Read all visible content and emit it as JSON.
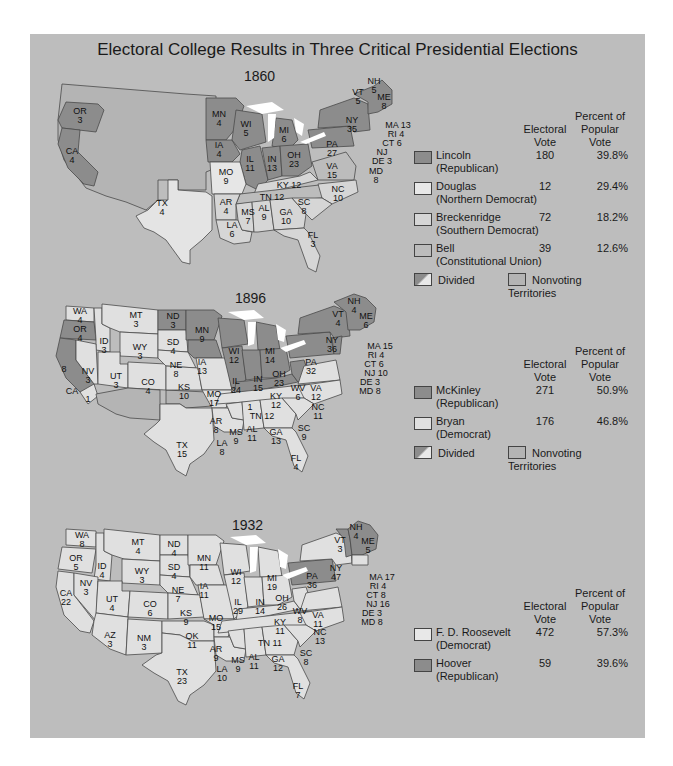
{
  "title": "Electoral College Results in Three Critical Presidential Elections",
  "colors": {
    "panel": "#bdbdbd",
    "republican_win": "#8c8c8c",
    "light_win": "#e6e6e6",
    "breckenridge": "#d6d6d6",
    "bell": "#bcbcbc",
    "nonvoting": "#b4b4b4",
    "lakes": "#ffffff",
    "border": "#4a4a4a"
  },
  "legend_headers": {
    "electoral": "Electoral Vote",
    "electoral_line1": "Electoral",
    "electoral_line2": "Vote",
    "popular_line1": "Percent of",
    "popular_line2": "Popular",
    "popular_line3": "Vote"
  },
  "elections": [
    {
      "year": "1860",
      "candidates": [
        {
          "name": "Lincoln",
          "party": "(Republican)",
          "electoral_vote": "180",
          "popular_vote": "39.8%",
          "color": "#8c8c8c"
        },
        {
          "name": "Douglas",
          "party": "(Northern Democrat)",
          "electoral_vote": "12",
          "popular_vote": "29.4%",
          "color": "#e8e8e8"
        },
        {
          "name": "Breckenridge",
          "party": "(Southern Democrat)",
          "electoral_vote": "72",
          "popular_vote": "18.2%",
          "color": "#d6d6d6"
        },
        {
          "name": "Bell",
          "party": "(Constitutional Union)",
          "electoral_vote": "39",
          "popular_vote": "12.6%",
          "color": "#bcbcbc"
        }
      ],
      "footer": {
        "divided": "Divided",
        "nonvoting": "Nonvoting Territories"
      },
      "states": [
        {
          "abbr": "OR",
          "votes": "3"
        },
        {
          "abbr": "CA",
          "votes": "4"
        },
        {
          "abbr": "TX",
          "votes": "4"
        },
        {
          "abbr": "MN",
          "votes": "4"
        },
        {
          "abbr": "IA",
          "votes": "4"
        },
        {
          "abbr": "MO",
          "votes": "9"
        },
        {
          "abbr": "AR",
          "votes": "4"
        },
        {
          "abbr": "LA",
          "votes": "6"
        },
        {
          "abbr": "WI",
          "votes": "5"
        },
        {
          "abbr": "IL",
          "votes": "11"
        },
        {
          "abbr": "MI",
          "votes": "6"
        },
        {
          "abbr": "IN",
          "votes": "13"
        },
        {
          "abbr": "OH",
          "votes": "23"
        },
        {
          "abbr": "KY",
          "votes": "12"
        },
        {
          "abbr": "TN",
          "votes": "12"
        },
        {
          "abbr": "MS",
          "votes": "7"
        },
        {
          "abbr": "AL",
          "votes": "9"
        },
        {
          "abbr": "GA",
          "votes": "10"
        },
        {
          "abbr": "FL",
          "votes": "3"
        },
        {
          "abbr": "SC",
          "votes": "8"
        },
        {
          "abbr": "NC",
          "votes": "10"
        },
        {
          "abbr": "VA",
          "votes": "15"
        },
        {
          "abbr": "PA",
          "votes": "27"
        },
        {
          "abbr": "NY",
          "votes": "35"
        },
        {
          "abbr": "VT",
          "votes": "5"
        },
        {
          "abbr": "NH",
          "votes": "5"
        },
        {
          "abbr": "ME",
          "votes": "8"
        },
        {
          "abbr": "MA",
          "votes": "13"
        },
        {
          "abbr": "RI",
          "votes": "4"
        },
        {
          "abbr": "CT",
          "votes": "6"
        },
        {
          "abbr": "NJ",
          "votes": ""
        },
        {
          "abbr": "DE",
          "votes": "3"
        },
        {
          "abbr": "MD",
          "votes": "8"
        }
      ]
    },
    {
      "year": "1896",
      "candidates": [
        {
          "name": "McKinley",
          "party": "(Republican)",
          "electoral_vote": "271",
          "popular_vote": "50.9%",
          "color": "#8c8c8c"
        },
        {
          "name": "Bryan",
          "party": "(Democrat)",
          "electoral_vote": "176",
          "popular_vote": "46.8%",
          "color": "#e0e0e0"
        }
      ],
      "footer": {
        "divided": "Divided",
        "nonvoting": "Nonvoting Territories"
      },
      "states": [
        {
          "abbr": "WA",
          "votes": "4"
        },
        {
          "abbr": "OR",
          "votes": "4"
        },
        {
          "abbr": "CA",
          "votes": "8"
        },
        {
          "abbr": "CA-split",
          "votes": "1"
        },
        {
          "abbr": "ID",
          "votes": "3"
        },
        {
          "abbr": "NV",
          "votes": "3"
        },
        {
          "abbr": "MT",
          "votes": "3"
        },
        {
          "abbr": "WY",
          "votes": "3"
        },
        {
          "abbr": "UT",
          "votes": "3"
        },
        {
          "abbr": "CO",
          "votes": "4"
        },
        {
          "abbr": "ND",
          "votes": "3"
        },
        {
          "abbr": "SD",
          "votes": "4"
        },
        {
          "abbr": "NE",
          "votes": "8"
        },
        {
          "abbr": "KS",
          "votes": "10"
        },
        {
          "abbr": "TX",
          "votes": "15"
        },
        {
          "abbr": "MN",
          "votes": "9"
        },
        {
          "abbr": "IA",
          "votes": "13"
        },
        {
          "abbr": "MO",
          "votes": "17"
        },
        {
          "abbr": "AR",
          "votes": "8"
        },
        {
          "abbr": "LA",
          "votes": "8"
        },
        {
          "abbr": "WI",
          "votes": "12"
        },
        {
          "abbr": "IL",
          "votes": "24"
        },
        {
          "abbr": "MI",
          "votes": "14"
        },
        {
          "abbr": "IN",
          "votes": "15"
        },
        {
          "abbr": "OH",
          "votes": "23"
        },
        {
          "abbr": "KY",
          "votes": "12"
        },
        {
          "abbr": "KY-split",
          "votes": "1"
        },
        {
          "abbr": "WV",
          "votes": "6"
        },
        {
          "abbr": "VA",
          "votes": "12"
        },
        {
          "abbr": "TN",
          "votes": "12"
        },
        {
          "abbr": "MS",
          "votes": "9"
        },
        {
          "abbr": "AL",
          "votes": "11"
        },
        {
          "abbr": "GA",
          "votes": "13"
        },
        {
          "abbr": "FL",
          "votes": "4"
        },
        {
          "abbr": "SC",
          "votes": "9"
        },
        {
          "abbr": "NC",
          "votes": "11"
        },
        {
          "abbr": "PA",
          "votes": "32"
        },
        {
          "abbr": "NY",
          "votes": "36"
        },
        {
          "abbr": "VT",
          "votes": "4"
        },
        {
          "abbr": "NH",
          "votes": "4"
        },
        {
          "abbr": "ME",
          "votes": "6"
        },
        {
          "abbr": "MA",
          "votes": "15"
        },
        {
          "abbr": "RI",
          "votes": "4"
        },
        {
          "abbr": "CT",
          "votes": "6"
        },
        {
          "abbr": "NJ",
          "votes": "10"
        },
        {
          "abbr": "DE",
          "votes": "3"
        },
        {
          "abbr": "MD",
          "votes": "8"
        }
      ]
    },
    {
      "year": "1932",
      "candidates": [
        {
          "name": "F. D. Roosevelt",
          "party": "(Democrat)",
          "electoral_vote": "472",
          "popular_vote": "57.3%",
          "color": "#e0e0e0"
        },
        {
          "name": "Hoover",
          "party": "(Republican)",
          "electoral_vote": "59",
          "popular_vote": "39.6%",
          "color": "#8c8c8c"
        }
      ],
      "states": [
        {
          "abbr": "WA",
          "votes": "8"
        },
        {
          "abbr": "OR",
          "votes": "5"
        },
        {
          "abbr": "CA",
          "votes": "22"
        },
        {
          "abbr": "ID",
          "votes": "4"
        },
        {
          "abbr": "NV",
          "votes": "3"
        },
        {
          "abbr": "MT",
          "votes": "4"
        },
        {
          "abbr": "WY",
          "votes": "3"
        },
        {
          "abbr": "UT",
          "votes": "4"
        },
        {
          "abbr": "CO",
          "votes": "6"
        },
        {
          "abbr": "AZ",
          "votes": "3"
        },
        {
          "abbr": "NM",
          "votes": "3"
        },
        {
          "abbr": "ND",
          "votes": "4"
        },
        {
          "abbr": "SD",
          "votes": "4"
        },
        {
          "abbr": "NE",
          "votes": "7"
        },
        {
          "abbr": "KS",
          "votes": "9"
        },
        {
          "abbr": "OK",
          "votes": "11"
        },
        {
          "abbr": "TX",
          "votes": "23"
        },
        {
          "abbr": "MN",
          "votes": "11"
        },
        {
          "abbr": "IA",
          "votes": "11"
        },
        {
          "abbr": "MO",
          "votes": "15"
        },
        {
          "abbr": "AR",
          "votes": "9"
        },
        {
          "abbr": "LA",
          "votes": "10"
        },
        {
          "abbr": "WI",
          "votes": "12"
        },
        {
          "abbr": "IL",
          "votes": "29"
        },
        {
          "abbr": "MI",
          "votes": "19"
        },
        {
          "abbr": "IN",
          "votes": "14"
        },
        {
          "abbr": "OH",
          "votes": "26"
        },
        {
          "abbr": "KY",
          "votes": "11"
        },
        {
          "abbr": "WV",
          "votes": "8"
        },
        {
          "abbr": "VA",
          "votes": "11"
        },
        {
          "abbr": "TN",
          "votes": "11"
        },
        {
          "abbr": "MS",
          "votes": "9"
        },
        {
          "abbr": "AL",
          "votes": "11"
        },
        {
          "abbr": "GA",
          "votes": "12"
        },
        {
          "abbr": "FL",
          "votes": "7"
        },
        {
          "abbr": "SC",
          "votes": "8"
        },
        {
          "abbr": "NC",
          "votes": "13"
        },
        {
          "abbr": "PA",
          "votes": "36"
        },
        {
          "abbr": "NY",
          "votes": "47"
        },
        {
          "abbr": "VT",
          "votes": "3"
        },
        {
          "abbr": "NH",
          "votes": "4"
        },
        {
          "abbr": "ME",
          "votes": "5"
        },
        {
          "abbr": "MA",
          "votes": "17"
        },
        {
          "abbr": "RI",
          "votes": "4"
        },
        {
          "abbr": "CT",
          "votes": "8"
        },
        {
          "abbr": "NJ",
          "votes": "16"
        },
        {
          "abbr": "DE",
          "votes": "3"
        },
        {
          "abbr": "MD",
          "votes": "8"
        }
      ]
    }
  ]
}
